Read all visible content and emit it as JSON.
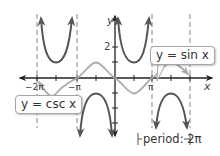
{
  "figure": {
    "type": "function-graph",
    "x_axis_label": "x",
    "y_axis_label": "y",
    "x_tick_labels": [
      "−2π",
      "−π",
      "π"
    ],
    "y_tick_labels": [
      "2"
    ],
    "callouts": {
      "sin": "y = sin x",
      "csc": "y = csc x"
    },
    "period_label": "period: 2π",
    "colors": {
      "csc_curve": "#555555",
      "sin_curve": "#a8a8a8",
      "axis": "#222222",
      "asymptote": "#888888"
    },
    "asymptotes_at": [
      "−2π",
      "−π",
      "0",
      "π",
      "2π"
    ]
  }
}
